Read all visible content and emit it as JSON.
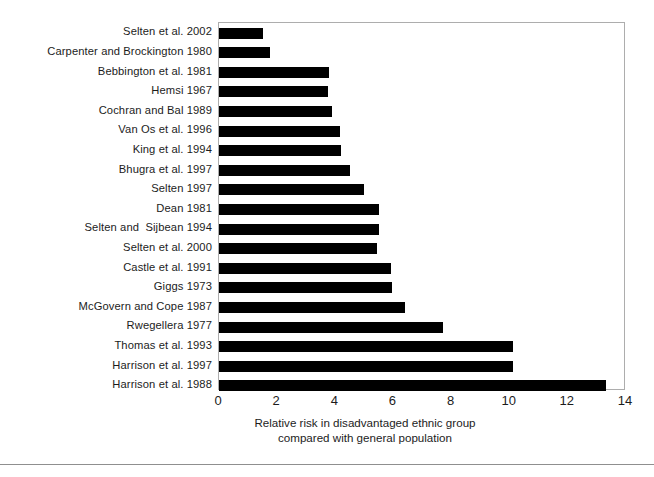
{
  "chart_data": {
    "type": "bar",
    "orientation": "horizontal",
    "title": "",
    "subtitle": "",
    "xlabel_lines": [
      "Relative risk in disadvantaged ethnic group",
      "compared with general population"
    ],
    "ylabel": "",
    "xlim": [
      0,
      14
    ],
    "xticks": [
      0,
      2,
      4,
      6,
      8,
      10,
      12,
      14
    ],
    "xtick_labels": [
      "0",
      "2",
      "4",
      "6",
      "8",
      "10",
      "12",
      "14"
    ],
    "grid": false,
    "legend": false,
    "bar_color": "#000000",
    "frame_color": "#adadad",
    "categories": [
      "Selten et al. 2002",
      "Carpenter and Brockington 1980",
      "Bebbington et al. 1981",
      "Hemsi 1967",
      "Cochran and Bal 1989",
      "Van Os et al. 1996",
      "King et al. 1994",
      "Bhugra et al. 1997",
      "Selten 1997",
      "Dean 1981",
      "Selten and  Sijbean 1994",
      "Selten et al. 2000",
      "Castle et al. 1991",
      "Giggs 1973",
      "McGovern and Cope 1987",
      "Rwegellera 1977",
      "Thomas et al. 1993",
      "Harrison et al. 1997",
      "Harrison et al. 1988"
    ],
    "values": [
      1.5,
      1.75,
      3.8,
      3.75,
      3.9,
      4.15,
      4.2,
      4.5,
      5.0,
      5.5,
      5.5,
      5.45,
      5.9,
      5.95,
      6.4,
      7.7,
      10.1,
      10.1,
      13.3
    ]
  }
}
